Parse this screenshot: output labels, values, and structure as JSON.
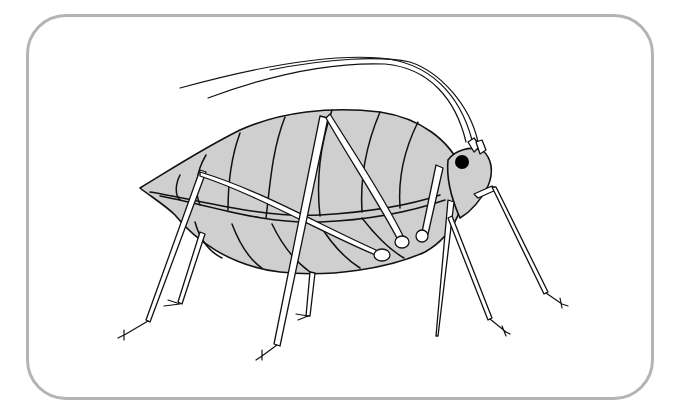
{
  "image": {
    "subject": "aphid line illustration",
    "caption": "Aphid",
    "colors": {
      "frame_border": "#b4b4b4",
      "body_fill": "#cfcfcf",
      "outline": "#111111",
      "background": "#ffffff"
    }
  }
}
